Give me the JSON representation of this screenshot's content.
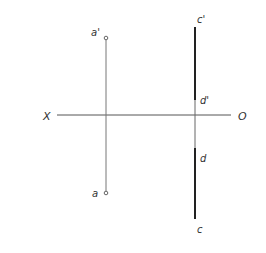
{
  "diagram": {
    "type": "orthographic-projection",
    "axis": {
      "left_label": "X",
      "right_label": "O",
      "y": 115,
      "x_start": 57,
      "x_end": 231,
      "color": "#555555"
    },
    "line_ab": {
      "x": 106,
      "top_point": {
        "label": "a'",
        "y": 38
      },
      "bottom_point": {
        "label": "a",
        "y": 193
      },
      "color": "#777777"
    },
    "line_cd": {
      "x": 195,
      "points": {
        "c_prime": {
          "label": "c'",
          "y": 27
        },
        "d_prime": {
          "label": "d'",
          "y": 100
        },
        "d": {
          "label": "d",
          "y": 148
        },
        "c": {
          "label": "c",
          "y": 219
        }
      },
      "thick_color": "#222222",
      "thin_color": "#666666"
    }
  }
}
